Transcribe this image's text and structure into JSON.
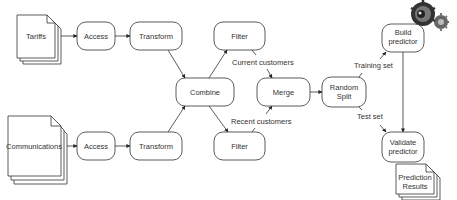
{
  "diagram": {
    "documents": {
      "tariffs": "Tariffs",
      "communications": "Communications",
      "prediction_results": [
        "Prediction",
        "Results"
      ]
    },
    "processes": {
      "access_top": "Access",
      "transform_top": "Transform",
      "access_bottom": "Access",
      "transform_bottom": "Transform",
      "combine": "Combine",
      "filter_top": "Filter",
      "filter_bottom": "Filter",
      "merge": "Merge",
      "random_split": [
        "Random",
        "Split"
      ],
      "build_predictor": [
        "Build",
        "predictor"
      ],
      "validate_predictor": [
        "Validate",
        "predictor"
      ]
    },
    "edge_labels": {
      "current_customers": "Current customers",
      "recent_customers": "Recent customers",
      "training_set": "Training set",
      "test_set": "Test set"
    },
    "icons": {
      "gears": "gears-icon"
    },
    "colors": {
      "stroke": "#333333",
      "background": "#ffffff"
    }
  }
}
